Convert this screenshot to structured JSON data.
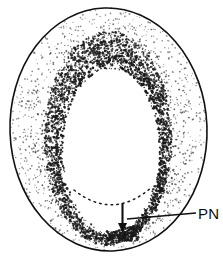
{
  "figure": {
    "kind": "anatomical-cross-section-line-drawing",
    "background_color": "#ffffff",
    "ink_color": "#111111",
    "stipple_color": "#1a1a1a",
    "outline_width_px": 1.6
  },
  "shapes": {
    "outer_oval": {
      "name": "outer-boundary",
      "cx": 108.5,
      "cy": 129.5,
      "rx": 98.5,
      "ry": 121.5,
      "rotation_deg": -2
    },
    "inner_oval": {
      "name": "inner-cavity",
      "cx": 111,
      "cy": 150,
      "rx": 48,
      "ry": 81,
      "rotation_deg": -1
    },
    "dotted_arc": {
      "name": "dotted-inner-contour",
      "start_x": 74,
      "start_y": 190,
      "end_x": 152,
      "end_y": 187,
      "sag_y": 209,
      "dash_pattern": "1.6 4.2"
    }
  },
  "annotations": {
    "arrow": {
      "label": "arrow-pointer",
      "x": 122.5,
      "y_start": 203,
      "y_end": 233,
      "head_width": 9,
      "head_length": 10,
      "direction": "down"
    },
    "leader_line": {
      "label": "leader-line",
      "x_start": 127,
      "y_start": 219,
      "x_end": 196,
      "y_end": 213
    },
    "callout": {
      "text": "PN",
      "x": 198,
      "y": 219,
      "font_size_px": 15,
      "color": "#0d0d0d"
    }
  },
  "stipple": {
    "bands": [
      {
        "name": "outer-light-field",
        "density": "light",
        "opacity": 0.62
      },
      {
        "name": "mid-field",
        "density": "medium",
        "opacity": 0.78
      },
      {
        "name": "inner-dark-rim",
        "density": "heavy",
        "opacity": 0.95
      }
    ],
    "seed": 20240517,
    "total_points_outer": 5200,
    "total_points_rim": 2600
  }
}
